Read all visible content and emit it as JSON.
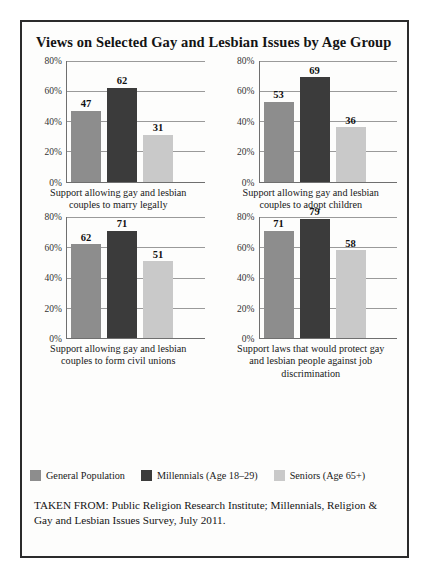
{
  "figure": {
    "title": "Views on Selected Gay and Lesbian Issues by Age Group",
    "source_note": "TAKEN FROM: Public Religion Research Institute; Millennials, Religion & Gay and Lesbian Issues Survey, July 2011."
  },
  "colors": {
    "general_population": "#8d8d8d",
    "millennials": "#3b3b3b",
    "seniors": "#c9c9c9",
    "border": "#2b2b2b",
    "axis": "#6f6f6f",
    "gridline": "#9a9a9a"
  },
  "legend": {
    "position": "bottom",
    "items": [
      {
        "label": "General Population",
        "color": "#8d8d8d"
      },
      {
        "label": "Millennials (Age 18–29)",
        "color": "#3b3b3b"
      },
      {
        "label": "Seniors (Age 65+)",
        "color": "#c9c9c9"
      }
    ]
  },
  "chart_data": [
    {
      "type": "bar",
      "title": "Support allowing gay and lesbian couples to marry legally",
      "categories": [
        "General Population",
        "Millennials (Age 18–29)",
        "Seniors (Age 65+)"
      ],
      "values": [
        47,
        62,
        31
      ],
      "value_labels": [
        "47",
        "62",
        "31"
      ],
      "xlabel": "",
      "ylabel": "",
      "ylim": [
        0,
        80
      ],
      "yticks": [
        0,
        20,
        40,
        60,
        80
      ],
      "ytick_labels": [
        "0%",
        "20%",
        "40%",
        "60%",
        "80%"
      ],
      "grid": true
    },
    {
      "type": "bar",
      "title": "Support allowing gay and lesbian couples to adopt children",
      "categories": [
        "General Population",
        "Millennials (Age 18–29)",
        "Seniors (Age 65+)"
      ],
      "values": [
        53,
        69,
        36
      ],
      "value_labels": [
        "53",
        "69",
        "36"
      ],
      "xlabel": "",
      "ylabel": "",
      "ylim": [
        0,
        80
      ],
      "yticks": [
        0,
        20,
        40,
        60,
        80
      ],
      "ytick_labels": [
        "0%",
        "20%",
        "40%",
        "60%",
        "80%"
      ],
      "grid": true
    },
    {
      "type": "bar",
      "title": "Support allowing gay and lesbian couples to form civil unions",
      "categories": [
        "General Population",
        "Millennials (Age 18–29)",
        "Seniors (Age 65+)"
      ],
      "values": [
        62,
        71,
        51
      ],
      "value_labels": [
        "62",
        "71",
        "51"
      ],
      "xlabel": "",
      "ylabel": "",
      "ylim": [
        0,
        80
      ],
      "yticks": [
        0,
        20,
        40,
        60,
        80
      ],
      "ytick_labels": [
        "0%",
        "20%",
        "40%",
        "60%",
        "80%"
      ],
      "grid": true
    },
    {
      "type": "bar",
      "title": "Support laws that would protect gay and lesbian people against job discrimination",
      "categories": [
        "General Population",
        "Millennials (Age 18–29)",
        "Seniors (Age 65+)"
      ],
      "values": [
        71,
        79,
        58
      ],
      "value_labels": [
        "71",
        "79",
        "58"
      ],
      "xlabel": "",
      "ylabel": "",
      "ylim": [
        0,
        80
      ],
      "yticks": [
        0,
        20,
        40,
        60,
        80
      ],
      "ytick_labels": [
        "0%",
        "20%",
        "40%",
        "60%",
        "80%"
      ],
      "grid": true
    }
  ]
}
